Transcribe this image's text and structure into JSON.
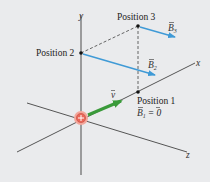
{
  "figure": {
    "caption_fragment": "",
    "axes": {
      "x_label": "x",
      "y_label": "y",
      "z_label": "z"
    },
    "charge": {
      "symbol": "+",
      "color": "#e8685a"
    },
    "velocity": {
      "label": "v",
      "color": "#3a9a3a"
    },
    "positions": [
      {
        "label": "Position 1",
        "field_label": "B",
        "field_sub": "1",
        "field_value": "= 0"
      },
      {
        "label": "Position 2",
        "field_label": "B",
        "field_sub": "2"
      },
      {
        "label": "Position 3",
        "field_label": "B",
        "field_sub": "3"
      }
    ],
    "colors": {
      "background": "#eaebed",
      "axis": "#555555",
      "field_vector": "#3f9ad6",
      "dashed": "#555555"
    }
  }
}
